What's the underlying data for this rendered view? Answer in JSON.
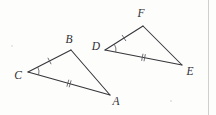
{
  "figure": {
    "background_color": "#fdfdfc",
    "stroke_color": "#35353a",
    "mark_color": "#56565c",
    "label_color": "#2f2f34",
    "width": 216,
    "height": 115
  },
  "triangles": [
    {
      "name": "triangle-abc",
      "vertices": [
        {
          "label": "C",
          "x": 28,
          "y": 72,
          "label_x": 18,
          "label_y": 76
        },
        {
          "label": "B",
          "x": 71,
          "y": 50,
          "label_x": 69,
          "label_y": 40
        },
        {
          "label": "A",
          "x": 110,
          "y": 95,
          "label_x": 116,
          "label_y": 102
        }
      ],
      "edges": [
        {
          "name": "edge-cb",
          "from": "C",
          "to": "B",
          "ticks": 1
        },
        {
          "name": "edge-ba",
          "from": "B",
          "to": "A",
          "ticks": 0
        },
        {
          "name": "edge-ca",
          "from": "C",
          "to": "A",
          "ticks": 2
        }
      ],
      "marked_angle": {
        "at": "C",
        "arc_radius": 11
      }
    },
    {
      "name": "triangle-def",
      "vertices": [
        {
          "label": "D",
          "x": 105,
          "y": 50,
          "label_x": 96,
          "label_y": 47
        },
        {
          "label": "F",
          "x": 143,
          "y": 26,
          "label_x": 141,
          "label_y": 14
        },
        {
          "label": "E",
          "x": 182,
          "y": 65,
          "label_x": 190,
          "label_y": 72
        }
      ],
      "edges": [
        {
          "name": "edge-df",
          "from": "D",
          "to": "F",
          "ticks": 1
        },
        {
          "name": "edge-fe",
          "from": "F",
          "to": "E",
          "ticks": 0
        },
        {
          "name": "edge-de",
          "from": "D",
          "to": "E",
          "ticks": 2
        }
      ],
      "marked_angle": {
        "at": "D",
        "arc_radius": 11
      }
    }
  ],
  "artifacts": {
    "scan_edge_x": 208.5,
    "specks": [
      {
        "x": 171,
        "y": 101,
        "r": 1.1
      },
      {
        "x": 12,
        "y": 46,
        "r": 1.0
      }
    ]
  }
}
